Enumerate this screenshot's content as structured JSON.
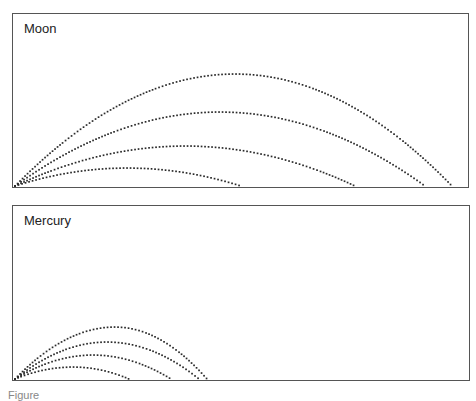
{
  "panels": [
    {
      "id": "moon",
      "label": "Moon",
      "box": {
        "left": 12,
        "top": 13,
        "width": 457,
        "height": 175
      },
      "origin": [
        2,
        172
      ],
      "trajectories": [
        {
          "peak_x": 220,
          "peak_h": 112,
          "range": 437
        },
        {
          "peak_x": 205,
          "peak_h": 74,
          "range": 410
        },
        {
          "peak_x": 170,
          "peak_h": 40,
          "range": 340
        },
        {
          "peak_x": 112,
          "peak_h": 18,
          "range": 226
        }
      ]
    },
    {
      "id": "mercury",
      "label": "Mercury",
      "box": {
        "left": 12,
        "top": 205,
        "width": 458,
        "height": 176
      },
      "origin": [
        2,
        173
      ],
      "trajectories": [
        {
          "peak_x": 100,
          "peak_h": 52,
          "range": 192
        },
        {
          "peak_x": 92,
          "peak_h": 37,
          "range": 184
        },
        {
          "peak_x": 78,
          "peak_h": 24,
          "range": 156
        },
        {
          "peak_x": 58,
          "peak_h": 12,
          "range": 114
        }
      ]
    }
  ],
  "caption": "Figure"
}
